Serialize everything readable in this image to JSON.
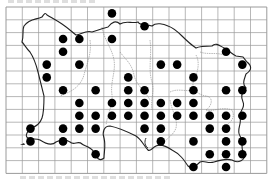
{
  "map": {
    "title": "",
    "type": "dot distribution map on square grid",
    "grid": {
      "columns": 16,
      "rows": 13
    },
    "colors": {
      "grid": "#9a9a9a",
      "coast": "#222222",
      "parish": "#8a8a8a",
      "dot": "#000000",
      "background": "#ffffff"
    },
    "records": [
      {
        "col": 6,
        "row": 0
      },
      {
        "col": 8,
        "row": 1
      },
      {
        "col": 3,
        "row": 2
      },
      {
        "col": 4,
        "row": 2
      },
      {
        "col": 6,
        "row": 2
      },
      {
        "col": 3,
        "row": 3
      },
      {
        "col": 13,
        "row": 3
      },
      {
        "col": 2,
        "row": 4
      },
      {
        "col": 4,
        "row": 4
      },
      {
        "col": 9,
        "row": 4
      },
      {
        "col": 10,
        "row": 4
      },
      {
        "col": 14,
        "row": 4
      },
      {
        "col": 2,
        "row": 5
      },
      {
        "col": 7,
        "row": 5
      },
      {
        "col": 11,
        "row": 5
      },
      {
        "col": 3,
        "row": 6
      },
      {
        "col": 5,
        "row": 6
      },
      {
        "col": 7,
        "row": 6
      },
      {
        "col": 8,
        "row": 6
      },
      {
        "col": 11,
        "row": 6
      },
      {
        "col": 13,
        "row": 6
      },
      {
        "col": 14,
        "row": 6
      },
      {
        "col": 4,
        "row": 7
      },
      {
        "col": 6,
        "row": 7
      },
      {
        "col": 7,
        "row": 7
      },
      {
        "col": 8,
        "row": 7
      },
      {
        "col": 9,
        "row": 7
      },
      {
        "col": 10,
        "row": 7
      },
      {
        "col": 11,
        "row": 7
      },
      {
        "col": 4,
        "row": 8
      },
      {
        "col": 5,
        "row": 8
      },
      {
        "col": 6,
        "row": 8
      },
      {
        "col": 7,
        "row": 8
      },
      {
        "col": 8,
        "row": 8
      },
      {
        "col": 9,
        "row": 8
      },
      {
        "col": 10,
        "row": 8
      },
      {
        "col": 11,
        "row": 8
      },
      {
        "col": 12,
        "row": 8
      },
      {
        "col": 13,
        "row": 8
      },
      {
        "col": 14,
        "row": 8
      },
      {
        "col": 1,
        "row": 9
      },
      {
        "col": 3,
        "row": 9
      },
      {
        "col": 4,
        "row": 9
      },
      {
        "col": 5,
        "row": 9
      },
      {
        "col": 8,
        "row": 9
      },
      {
        "col": 9,
        "row": 9
      },
      {
        "col": 12,
        "row": 9
      },
      {
        "col": 13,
        "row": 9
      },
      {
        "col": 1,
        "row": 10
      },
      {
        "col": 3,
        "row": 10
      },
      {
        "col": 9,
        "row": 10
      },
      {
        "col": 11,
        "row": 10
      },
      {
        "col": 13,
        "row": 10
      },
      {
        "col": 14,
        "row": 10
      },
      {
        "col": 5,
        "row": 11
      },
      {
        "col": 12,
        "row": 11
      },
      {
        "col": 13,
        "row": 11
      },
      {
        "col": 14,
        "row": 11
      },
      {
        "col": 11,
        "row": 12
      },
      {
        "col": 13,
        "row": 12
      }
    ]
  }
}
